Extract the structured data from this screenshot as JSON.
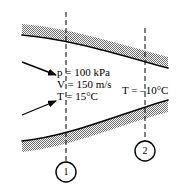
{
  "figure": {
    "width": 196,
    "height": 191,
    "background": "#ffffff"
  },
  "colors": {
    "wall_fill": "#a9a9a9",
    "wall_line": "#000000",
    "dashed_line": "#000000",
    "text": "#000000",
    "arrow": "#000000"
  },
  "inlet_properties": {
    "pressure": {
      "symbol": "p",
      "equals": "=",
      "value": "100",
      "unit": "kPa",
      "text": "p = 100 kPa"
    },
    "velocity": {
      "symbol": "V",
      "equals": "=",
      "value": "150",
      "unit": "m/s",
      "text": "V = 150 m/s"
    },
    "temperature": {
      "symbol": "T",
      "equals": "=",
      "value": "15",
      "unit": "°C",
      "text": "T = 15°C"
    }
  },
  "exit_properties": {
    "temperature": {
      "symbol": "T",
      "equals": "=",
      "value": "–10",
      "unit": "°C",
      "text": "T = –10°C"
    }
  },
  "stations": [
    {
      "id": "1",
      "label": "1",
      "x": 66,
      "y": 172,
      "radius": 10,
      "dash_x": 66
    },
    {
      "id": "2",
      "label": "2",
      "x": 145,
      "y": 151,
      "radius": 10,
      "dash_x": 145
    }
  ],
  "arrows": [
    {
      "name": "upper-inlet-arrow",
      "direction": "down-right",
      "x1": 22,
      "y1": 62,
      "x2": 58,
      "y2": 76
    },
    {
      "name": "lower-inlet-arrow",
      "direction": "up-right",
      "x1": 22,
      "y1": 114,
      "x2": 58,
      "y2": 100
    }
  ],
  "walls": [
    {
      "name": "upper-wall",
      "description": "shaded band curving downward to the right"
    },
    {
      "name": "lower-wall",
      "description": "shaded band curving upward to the right"
    }
  ],
  "dashed_lines": [
    {
      "name": "station-1-dashed-line",
      "x": 66,
      "y_top": 12,
      "y_bottom": 162
    },
    {
      "name": "station-2-dashed-line",
      "x": 145,
      "y_top": 28,
      "y_bottom": 141
    }
  ]
}
